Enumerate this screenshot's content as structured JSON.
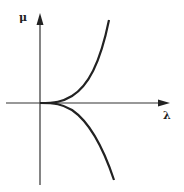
{
  "diagram": {
    "type": "bifurcation-cusp",
    "axes": {
      "vertical_label": "μ",
      "horizontal_label": "λ"
    },
    "curves": [
      {
        "name": "upper-branch",
        "description": "μ increases as λ^(3/2) above λ-axis"
      },
      {
        "name": "lower-branch",
        "description": "μ decreases as -λ^(3/2) below λ-axis"
      }
    ],
    "colors": {
      "line": "#222222",
      "background": "#ffffff"
    }
  }
}
